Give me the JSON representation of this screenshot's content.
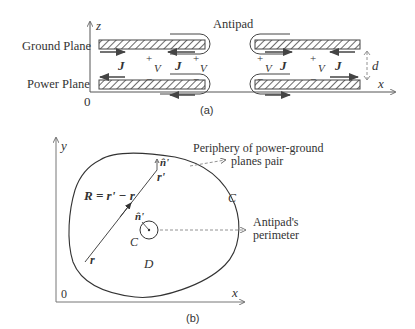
{
  "figure_a": {
    "caption": "(a)",
    "labels": {
      "ground_plane": "Ground Plane",
      "power_plane": "Power Plane",
      "antipad": "Antipad",
      "origin": "0",
      "axis_z": "z",
      "axis_x": "x",
      "distance": "d",
      "current": "J",
      "voltage": "V",
      "plus": "+",
      "minus": "−"
    }
  },
  "figure_b": {
    "caption": "(b)",
    "labels": {
      "axis_y": "y",
      "axis_x": "x",
      "origin": "0",
      "vector_eq": "R = r' − r",
      "r_prime": "r'",
      "r": "r",
      "normal": "n̂'",
      "normal_inner": "n̂'",
      "contour_outer": "C",
      "contour_inner": "C",
      "domain": "D",
      "periphery_line1": "Periphery of power-ground",
      "periphery_line2": "planes pair",
      "antipad_line1": "Antipad's",
      "antipad_line2": "perimeter"
    }
  },
  "colors": {
    "line": "#333333",
    "arrow": "#444444",
    "dashed": "#777777",
    "hatch": "#444444"
  }
}
